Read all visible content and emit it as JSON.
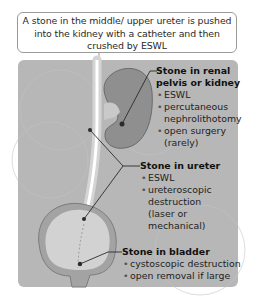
{
  "callout": {
    "text": "A stone in the middle/ upper ureter is pushed into the kidney with a catheter and then crushed by ESWL"
  },
  "labels": {
    "kidney": {
      "heading_line1": "Stone in renal",
      "heading_line2": "pelvis or kidney",
      "items": [
        "ESWL",
        "percutaneous nephrolithotomy",
        "open surgery (rarely)"
      ]
    },
    "ureter": {
      "heading": "Stone in ureter",
      "items": [
        "ESWL",
        "ureteroscopic destruction (laser or mechanical)"
      ]
    },
    "bladder": {
      "heading": "Stone in bladder",
      "items": [
        "cystoscopic destruction",
        "open removal if large"
      ]
    }
  },
  "colors": {
    "panel_bg": "#b7b7b7",
    "kidney": "#8f8f8f",
    "ureter": "#cfcfcf",
    "bladder_wall": "#a3a3a3",
    "bladder_inner": "#d2d2d2"
  }
}
